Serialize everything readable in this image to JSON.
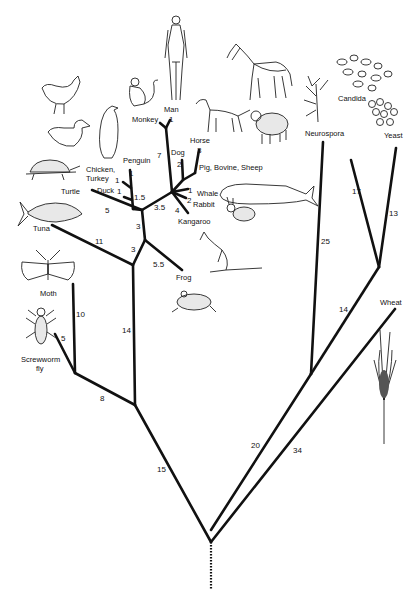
{
  "diagram": {
    "type": "phylogenetic-tree",
    "root": {
      "x": 216,
      "y": 490
    },
    "taxa": [
      {
        "id": "man",
        "label": "Man",
        "x": 172,
        "y": 103
      },
      {
        "id": "monkey",
        "label": "Monkey",
        "x": 120,
        "y": 117
      },
      {
        "id": "dog",
        "label": "Dog",
        "x": 176,
        "y": 153
      },
      {
        "id": "horse",
        "label": "Horse",
        "x": 192,
        "y": 141
      },
      {
        "id": "pig",
        "label": "Pig, Bovine, Sheep",
        "x": 200,
        "y": 171
      },
      {
        "id": "whale",
        "label": "Whale",
        "x": 199,
        "y": 197
      },
      {
        "id": "rabbit",
        "label": "Rabbit",
        "x": 194,
        "y": 206
      },
      {
        "id": "kangaroo",
        "label": "Kangaroo",
        "x": 177,
        "y": 226
      },
      {
        "id": "penguin",
        "label": "Penguin",
        "x": 123,
        "y": 163
      },
      {
        "id": "chicken",
        "label": "Chicken,",
        "x": 86,
        "y": 172
      },
      {
        "id": "turkey",
        "label": "Turkey",
        "x": 86,
        "y": 181
      },
      {
        "id": "duck",
        "label": "Duck",
        "x": 97,
        "y": 192
      },
      {
        "id": "turtle",
        "label": "Turtle",
        "x": 61,
        "y": 194
      },
      {
        "id": "tuna",
        "label": "Tuna",
        "x": 33,
        "y": 230
      },
      {
        "id": "frog",
        "label": "Frog",
        "x": 176,
        "y": 279
      },
      {
        "id": "moth",
        "label": "Moth",
        "x": 40,
        "y": 296
      },
      {
        "id": "screwworm",
        "label": "Screwworm",
        "x": 21,
        "y": 362
      },
      {
        "id": "fly",
        "label": "fly",
        "x": 36,
        "y": 372
      },
      {
        "id": "neurospora",
        "label": "Neurospora",
        "x": 306,
        "y": 134
      },
      {
        "id": "candida",
        "label": "Candida",
        "x": 338,
        "y": 101
      },
      {
        "id": "yeast",
        "label": "Yeast",
        "x": 385,
        "y": 136
      },
      {
        "id": "wheat",
        "label": "Wheat",
        "x": 380,
        "y": 303
      }
    ],
    "branch_lengths": [
      {
        "label": "1",
        "x": 171,
        "y": 123
      },
      {
        "label": "7",
        "x": 157,
        "y": 156
      },
      {
        "label": "2",
        "x": 178,
        "y": 167
      },
      {
        "label": "3",
        "x": 197,
        "y": 152
      },
      {
        "label": "1",
        "x": 188,
        "y": 193
      },
      {
        "label": "2",
        "x": 187,
        "y": 202
      },
      {
        "label": "4",
        "x": 175,
        "y": 213
      },
      {
        "label": "3.5",
        "x": 156,
        "y": 208
      },
      {
        "label": "1",
        "x": 128,
        "y": 176
      },
      {
        "label": "1",
        "x": 115,
        "y": 182
      },
      {
        "label": "1",
        "x": 118,
        "y": 194
      },
      {
        "label": "1.5",
        "x": 134,
        "y": 199
      },
      {
        "label": "5",
        "x": 106,
        "y": 212
      },
      {
        "label": "3",
        "x": 136,
        "y": 228
      },
      {
        "label": "3",
        "x": 131,
        "y": 251
      },
      {
        "label": "5.5",
        "x": 155,
        "y": 266
      },
      {
        "label": "11",
        "x": 96,
        "y": 243
      },
      {
        "label": "10",
        "x": 76,
        "y": 316
      },
      {
        "label": "5",
        "x": 61,
        "y": 341
      },
      {
        "label": "14",
        "x": 124,
        "y": 332
      },
      {
        "label": "8",
        "x": 101,
        "y": 400
      },
      {
        "label": "15",
        "x": 158,
        "y": 471
      },
      {
        "label": "25",
        "x": 322,
        "y": 243
      },
      {
        "label": "17",
        "x": 353,
        "y": 193
      },
      {
        "label": "13",
        "x": 390,
        "y": 215
      },
      {
        "label": "14",
        "x": 339,
        "y": 311
      },
      {
        "label": "20",
        "x": 253,
        "y": 447
      },
      {
        "label": "34",
        "x": 295,
        "y": 452
      }
    ],
    "illustrations": [
      "man",
      "monkey",
      "horse",
      "dog",
      "sheep",
      "whale",
      "rabbit",
      "kangaroo",
      "frog",
      "penguin",
      "chicken",
      "duck",
      "turtle",
      "tuna",
      "moth",
      "screwworm-fly",
      "neurospora",
      "candida",
      "yeast",
      "wheat"
    ]
  }
}
